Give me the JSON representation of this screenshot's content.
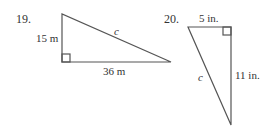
{
  "problems": [
    {
      "number": "19.",
      "legs": {
        "vertical": "15 m",
        "horizontal": "36 m"
      },
      "hypotenuse": "c"
    },
    {
      "number": "20.",
      "legs": {
        "horizontal": "5 in.",
        "vertical": "11 in."
      },
      "hypotenuse": "c"
    }
  ],
  "colors": {
    "stroke": "#555555",
    "text": "#333333"
  }
}
